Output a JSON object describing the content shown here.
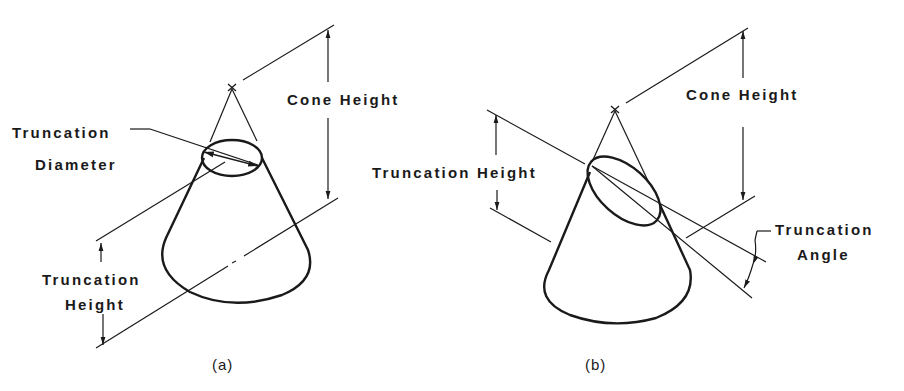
{
  "figure_a": {
    "caption": "(a)",
    "labels": {
      "cone_height": "Cone Height",
      "truncation_diameter_line1": "Truncation",
      "truncation_diameter_line2": "Diameter",
      "truncation_height_line1": "Truncation",
      "truncation_height_line2": "Height"
    }
  },
  "figure_b": {
    "caption": "(b)",
    "labels": {
      "cone_height": "Cone Height",
      "truncation_height": "Truncation Height",
      "truncation_angle_line1": "Truncation",
      "truncation_angle_line2": "Angle"
    }
  },
  "colors": {
    "stroke": "#1a1a1a",
    "background": "#ffffff"
  }
}
